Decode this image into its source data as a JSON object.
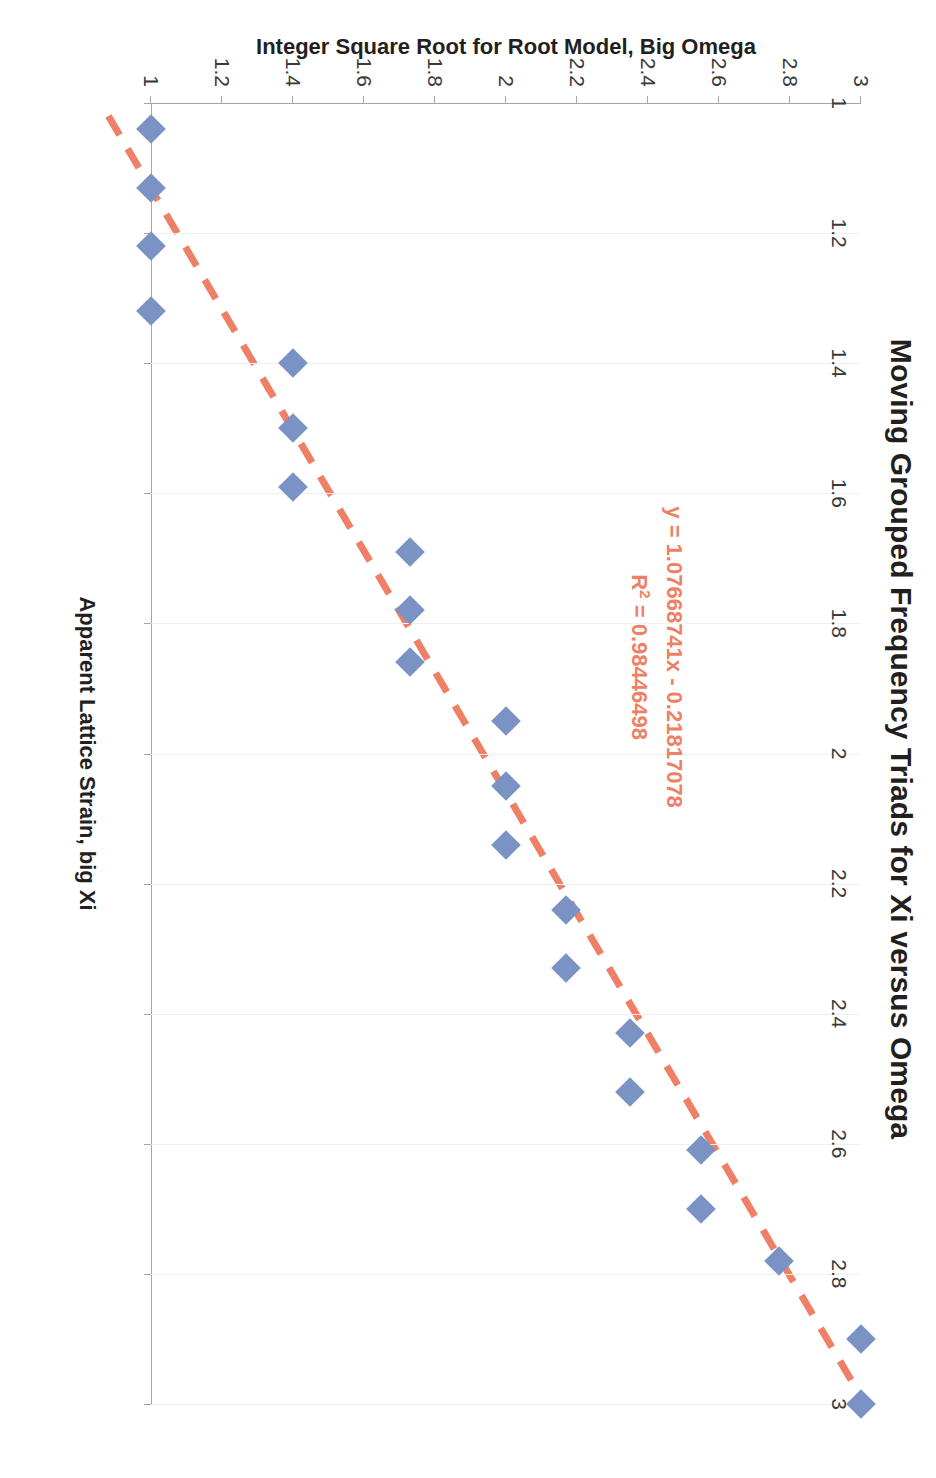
{
  "chart_data": {
    "type": "scatter",
    "title": "Moving Grouped Frequency Triads for Xi versus Omega",
    "xlabel": "Apparent Lattice Strain, big Xi",
    "ylabel": "Integer Square Root for Root Model, Big Omega",
    "xlim": [
      1,
      3
    ],
    "ylim": [
      1,
      3
    ],
    "xticks": [
      "1",
      "1.2",
      "1.4",
      "1.6",
      "1.8",
      "2",
      "2.2",
      "2.4",
      "2.6",
      "2.8",
      "3"
    ],
    "yticks": [
      "1",
      "1.2",
      "1.4",
      "1.6",
      "1.8",
      "2",
      "2.2",
      "2.4",
      "2.6",
      "2.8",
      "3"
    ],
    "xtick_values": [
      1,
      1.2,
      1.4,
      1.6,
      1.8,
      2,
      2.2,
      2.4,
      2.6,
      2.8,
      3
    ],
    "ytick_values": [
      1,
      1.2,
      1.4,
      1.6,
      1.8,
      2,
      2.2,
      2.4,
      2.6,
      2.8,
      3
    ],
    "grid": "vertical-light",
    "legend": "none",
    "marker_shape": "diamond",
    "marker_color": "#7b93c4",
    "trendline_color": "#ef7f65",
    "trendline_style": "dashed",
    "series": [
      {
        "name": "Xi versus Omega",
        "points": [
          {
            "x": 1.04,
            "y": 1.0
          },
          {
            "x": 1.13,
            "y": 1.0
          },
          {
            "x": 1.22,
            "y": 1.0
          },
          {
            "x": 1.32,
            "y": 1.0
          },
          {
            "x": 1.4,
            "y": 1.4
          },
          {
            "x": 1.5,
            "y": 1.4
          },
          {
            "x": 1.59,
            "y": 1.4
          },
          {
            "x": 1.69,
            "y": 1.73
          },
          {
            "x": 1.78,
            "y": 1.73
          },
          {
            "x": 1.86,
            "y": 1.73
          },
          {
            "x": 1.95,
            "y": 2.0
          },
          {
            "x": 2.05,
            "y": 2.0
          },
          {
            "x": 2.14,
            "y": 2.0
          },
          {
            "x": 2.24,
            "y": 2.17
          },
          {
            "x": 2.33,
            "y": 2.17
          },
          {
            "x": 2.43,
            "y": 2.35
          },
          {
            "x": 2.52,
            "y": 2.35
          },
          {
            "x": 2.61,
            "y": 2.55
          },
          {
            "x": 2.7,
            "y": 2.55
          },
          {
            "x": 2.78,
            "y": 2.77
          },
          {
            "x": 2.9,
            "y": 3.0
          },
          {
            "x": 3.0,
            "y": 3.0
          }
        ]
      }
    ],
    "trendline": {
      "slope": 1.07668741,
      "intercept": -0.21817078,
      "r_squared": 0.98446498,
      "x_start": 1.02,
      "x_end": 3.0
    },
    "annotations": {
      "equation": "y = 1.07668741x - 0.21817078",
      "r_squared_prefix": "R",
      "r_squared_exponent": "2",
      "r_squared_text": " = 0.98446498"
    }
  }
}
